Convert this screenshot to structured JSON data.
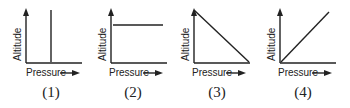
{
  "figure": {
    "ylabel": "Altitude",
    "xlabel": "Pressure",
    "line_color": "#222222",
    "panels": [
      {
        "caption": "(1)",
        "curve": "vertical"
      },
      {
        "caption": "(2)",
        "curve": "horizontal"
      },
      {
        "caption": "(3)",
        "curve": "decreasing"
      },
      {
        "caption": "(4)",
        "curve": "increasing"
      }
    ]
  }
}
